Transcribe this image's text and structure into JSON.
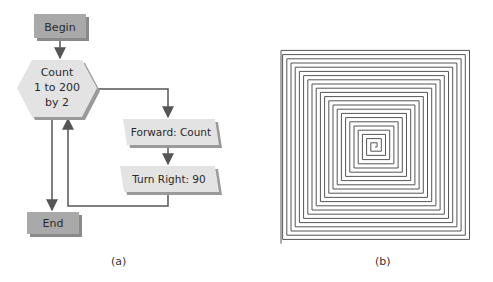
{
  "figure_a": {
    "caption": "(a)",
    "nodes": {
      "begin": "Begin",
      "loop_line1": "Count",
      "loop_line2": "1 to 200",
      "loop_line3": "by 2",
      "forward": "Forward: Count",
      "turn": "Turn Right: 90",
      "end": "End"
    }
  },
  "figure_b": {
    "caption": "(b)",
    "description": "Square spiral drawn by turtle"
  },
  "colors": {
    "terminal_fill": "#a9a9a9",
    "process_fill": "#e3e3e3",
    "shadow": "#8a8a8a",
    "line": "#555555",
    "spiral": "#555555"
  }
}
